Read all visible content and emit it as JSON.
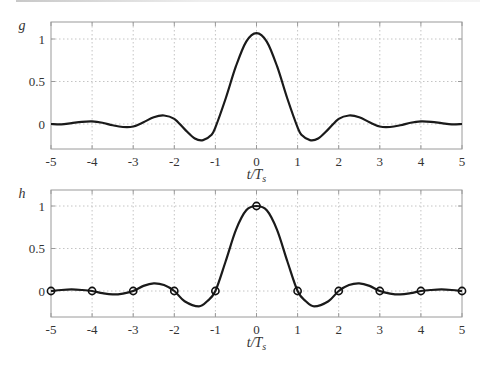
{
  "chart_data": [
    {
      "type": "line",
      "name": "g",
      "ylabel": "g",
      "xlabel": "t/T_s",
      "xlabel_main": "t/T",
      "xlabel_sub": "s",
      "xlim": [
        -5,
        5
      ],
      "ylim": [
        -0.29,
        1.2
      ],
      "xticks": [
        -5,
        -4,
        -3,
        -2,
        -1,
        0,
        1,
        2,
        3,
        4,
        5
      ],
      "xtick_labels": [
        "-5",
        "-4",
        "-3",
        "-2",
        "-1",
        "0",
        "1",
        "2",
        "3",
        "4",
        "5"
      ],
      "yticks": [
        0,
        0.5,
        1
      ],
      "ytick_labels": [
        "0",
        "",
        "1"
      ],
      "grid": true,
      "series": [
        {
          "name": "g(t)",
          "x": [
            -5,
            -4.75,
            -4.5,
            -4.25,
            -4,
            -3.75,
            -3.5,
            -3.25,
            -3,
            -2.75,
            -2.5,
            -2.25,
            -2,
            -1.75,
            -1.5,
            -1.3,
            -1.1,
            -1,
            -0.75,
            -0.5,
            -0.25,
            0,
            0.25,
            0.5,
            0.75,
            1,
            1.1,
            1.3,
            1.5,
            1.75,
            2,
            2.25,
            2.5,
            2.75,
            3,
            3.25,
            3.5,
            3.75,
            4,
            4.25,
            4.5,
            4.75,
            5
          ],
          "y": [
            0,
            -0.005,
            0.01,
            0.025,
            0.03,
            0.015,
            -0.015,
            -0.035,
            -0.03,
            0.02,
            0.08,
            0.1,
            0.06,
            -0.06,
            -0.17,
            -0.19,
            -0.13,
            -0.04,
            0.3,
            0.68,
            0.97,
            1.07,
            0.97,
            0.68,
            0.3,
            -0.04,
            -0.13,
            -0.19,
            -0.17,
            -0.06,
            0.06,
            0.1,
            0.08,
            0.02,
            -0.03,
            -0.035,
            -0.015,
            0.015,
            0.03,
            0.025,
            0.01,
            -0.005,
            0
          ]
        }
      ]
    },
    {
      "type": "line",
      "name": "h",
      "ylabel": "h",
      "xlabel": "t/T_s",
      "xlabel_main": "t/T",
      "xlabel_sub": "s",
      "xlim": [
        -5,
        5
      ],
      "ylim": [
        -0.29,
        1.2
      ],
      "xticks": [
        -5,
        -4,
        -3,
        -2,
        -1,
        0,
        1,
        2,
        3,
        4,
        5
      ],
      "xtick_labels": [
        "-5",
        "-4",
        "-3",
        "-2",
        "-1",
        "0",
        "1",
        "2",
        "3",
        "4",
        "5"
      ],
      "yticks": [
        0,
        0.5,
        1
      ],
      "ytick_labels": [
        "0",
        "",
        "1"
      ],
      "grid": true,
      "series": [
        {
          "name": "h(t)",
          "x": [
            -5,
            -4.75,
            -4.5,
            -4.25,
            -4,
            -3.75,
            -3.5,
            -3.25,
            -3,
            -2.75,
            -2.5,
            -2.25,
            -2,
            -1.75,
            -1.4,
            -1.2,
            -1,
            -0.75,
            -0.5,
            -0.25,
            0,
            0.25,
            0.5,
            0.75,
            1,
            1.2,
            1.4,
            1.75,
            2,
            2.25,
            2.5,
            2.75,
            3,
            3.25,
            3.5,
            3.75,
            4,
            4.25,
            4.5,
            4.75,
            5
          ],
          "y": [
            0,
            0.012,
            0.018,
            0.012,
            0,
            -0.025,
            -0.04,
            -0.03,
            0,
            0.06,
            0.09,
            0.07,
            0,
            -0.12,
            -0.18,
            -0.12,
            0,
            0.35,
            0.72,
            0.95,
            1,
            0.95,
            0.72,
            0.35,
            0,
            -0.12,
            -0.18,
            -0.12,
            0,
            0.07,
            0.09,
            0.06,
            0,
            -0.03,
            -0.04,
            -0.025,
            0,
            0.012,
            0.018,
            0.012,
            0
          ]
        },
        {
          "name": "samples",
          "marker": "circle",
          "x": [
            -5,
            -4,
            -3,
            -2,
            -1,
            0,
            1,
            2,
            3,
            4,
            5
          ],
          "y": [
            0,
            0,
            0,
            0,
            0,
            1,
            0,
            0,
            0,
            0,
            0
          ]
        }
      ]
    }
  ],
  "ytick_half_label": "0.5"
}
